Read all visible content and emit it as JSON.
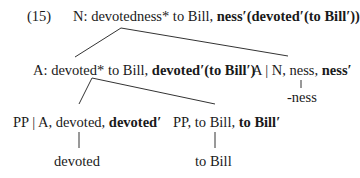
{
  "example_number": "(15)",
  "tree": {
    "root": {
      "plain": "N: devotedness* to Bill, ",
      "bold": "ness′(devoted′(to Bill′))"
    },
    "left": {
      "plain": "A: devoted* to Bill, ",
      "bold": "devoted′(to Bill′)"
    },
    "right": {
      "plain": "A | N, ness, ",
      "bold": "ness′",
      "leaf": "-ness"
    },
    "left_left": {
      "plain": "PP | A, devoted, ",
      "bold": "devoted′",
      "leaf": "devoted"
    },
    "left_right": {
      "plain": "PP, to Bill, ",
      "bold": "to Bill′",
      "leaf": "to Bill"
    }
  }
}
